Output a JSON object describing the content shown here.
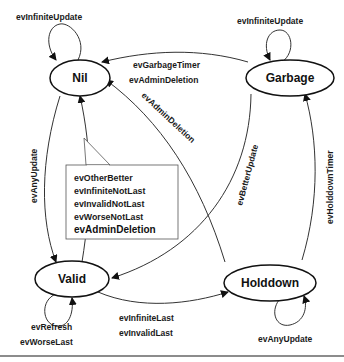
{
  "diagram": {
    "type": "state-machine",
    "states": {
      "nil": {
        "label": "Nil"
      },
      "garbage": {
        "label": "Garbage"
      },
      "valid": {
        "label": "Valid"
      },
      "holddown": {
        "label": "Holddown"
      }
    },
    "transitions": {
      "nil_self": "evInfiniteUpdate",
      "garbage_self": "evInfiniteUpdate",
      "garbage_to_nil_1": "evGarbageTimer",
      "garbage_to_nil_2": "evAdminDeletion",
      "holddown_to_nil": "evAdminDeletion",
      "nil_to_valid": "evAnyUpdate",
      "garbage_to_valid": "evBetterUpdate",
      "holddown_to_garbage": "evHolddownTimer",
      "valid_self_1": "evRefresh",
      "valid_self_2": "evWorseLast",
      "valid_to_holddown_1": "evInfiniteLast",
      "valid_to_holddown_2": "evInvalidLast",
      "holddown_self": "evAnyUpdate"
    },
    "note": {
      "lines": [
        "evOtherBetter",
        "evInfiniteNotLast",
        "evInvalidNotLast",
        "evWorseNotLast"
      ],
      "last": "evAdminDeletion"
    }
  }
}
